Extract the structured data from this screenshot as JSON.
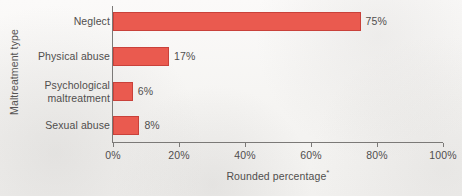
{
  "chart_data": {
    "type": "bar",
    "orientation": "horizontal",
    "title": "",
    "categories": [
      "Neglect",
      "Physical abuse",
      "Psychological maltreatment",
      "Sexual abuse"
    ],
    "values": [
      75,
      17,
      6,
      8
    ],
    "value_labels": [
      "75%",
      "17%",
      "6%",
      "8%"
    ],
    "xlabel": "Rounded percentage",
    "xlabel_footnote_marker": "*",
    "ylabel": "Maltreatment type",
    "xlim": [
      0,
      100
    ],
    "xticks": [
      0,
      20,
      40,
      60,
      80,
      100
    ],
    "xtick_labels": [
      "0%",
      "20%",
      "40%",
      "60%",
      "80%",
      "100%"
    ],
    "grid": false,
    "legend": null,
    "bar_color": "#ea5a4f",
    "bar_border_color": "#c9413a",
    "axis_color": "#7b7977",
    "text_color": "#504e4d",
    "background_color": "#f7f6f4"
  },
  "category_lines": [
    [
      "Neglect"
    ],
    [
      "Physical abuse"
    ],
    [
      "Psychological",
      "maltreatment"
    ],
    [
      "Sexual abuse"
    ]
  ]
}
